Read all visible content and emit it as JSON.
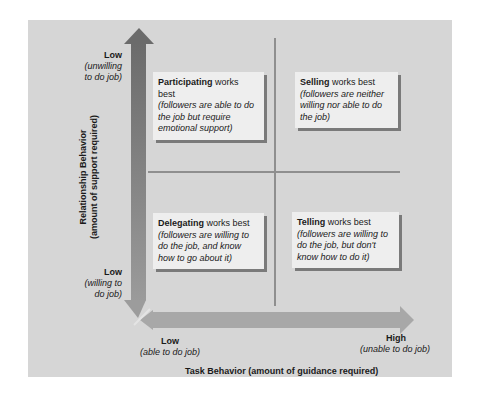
{
  "diagram": {
    "type": "quadrant",
    "y_axis": {
      "title": "Relationship Behavior",
      "subtitle": "(amount of support required)",
      "top": {
        "label": "Low",
        "note_line1": "(unwilling",
        "note_line2": "to do job)"
      },
      "bottom": {
        "label": "Low",
        "note_line1": "(willing to",
        "note_line2": "do job)"
      }
    },
    "x_axis": {
      "title": "Task Behavior (amount of guidance required)",
      "left": {
        "label": "Low",
        "note": "(able to do job)"
      },
      "right": {
        "label": "High",
        "note": "(unable to do job)"
      }
    },
    "quadrants": [
      {
        "position": "top-left",
        "style": "Participating",
        "suffix": " works best",
        "description": "(followers are able to do the job but require emotional support)"
      },
      {
        "position": "top-right",
        "style": "Selling",
        "suffix": " works best",
        "description": "(followers are neither willing nor able to do the job)"
      },
      {
        "position": "bottom-left",
        "style": "Delegating",
        "suffix": " works best",
        "description": "(followers are willing to do the job, and know how to go about it)"
      },
      {
        "position": "bottom-right",
        "style": "Telling",
        "suffix": " works best",
        "description": "(followers are willing to do the job, but don't know how to do it)"
      }
    ],
    "colors": {
      "panel": "#d6d6d6",
      "arrow_vertical_top": "#6e6e6e",
      "arrow_vertical_bottom": "#9a9a9a",
      "arrow_horizontal": "#a5a5a5",
      "gridline": "#8f8f8f",
      "box_bg": "#eeeeee",
      "box_shadow": "#7a7a7a"
    }
  }
}
